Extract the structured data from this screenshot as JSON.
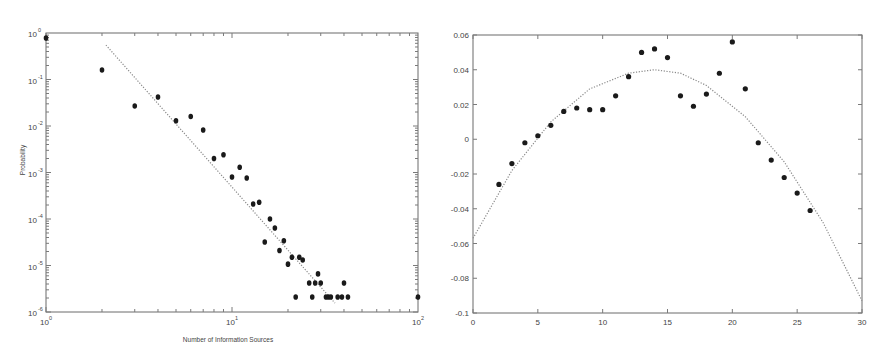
{
  "chart_data": [
    {
      "type": "scatter",
      "title": "",
      "xlabel": "Number of Information Sources",
      "ylabel": "Probability",
      "xscale": "log",
      "yscale": "log",
      "xlim": [
        1,
        100
      ],
      "ylim": [
        1e-06,
        1
      ],
      "x_ticks": [
        {
          "base": "10",
          "exp": "0",
          "value": 1
        },
        {
          "base": "10",
          "exp": "1",
          "value": 10
        },
        {
          "base": "10",
          "exp": "2",
          "value": 100
        }
      ],
      "y_ticks": [
        {
          "base": "10",
          "exp": "0",
          "value": 1
        },
        {
          "base": "10",
          "exp": "-1",
          "value": 0.1
        },
        {
          "base": "10",
          "exp": "-2",
          "value": 0.01
        },
        {
          "base": "10",
          "exp": "-3",
          "value": 0.001
        },
        {
          "base": "10",
          "exp": "-4",
          "value": 0.0001
        },
        {
          "base": "10",
          "exp": "-5",
          "value": 1e-05
        },
        {
          "base": "10",
          "exp": "-6",
          "value": 1e-06
        }
      ],
      "grid": false,
      "legend": null,
      "series": [
        {
          "name": "observed",
          "style": "markers",
          "x": [
            1,
            2,
            3,
            4,
            5,
            6,
            7,
            8,
            9,
            10,
            11,
            12,
            13,
            14,
            15,
            16,
            17,
            18,
            19,
            20,
            21,
            22,
            23,
            24,
            26,
            27,
            28,
            29,
            30,
            32,
            33,
            34,
            37,
            39,
            40,
            42,
            100
          ],
          "y": [
            0.78,
            0.16,
            0.027,
            0.042,
            0.013,
            0.016,
            0.0082,
            0.002,
            0.0024,
            0.0008,
            0.0013,
            0.00076,
            0.00021,
            0.00023,
            3.2e-05,
            0.0001,
            6.4e-05,
            2.1e-05,
            3.4e-05,
            1.07e-05,
            1.5e-05,
            2.1e-06,
            1.5e-05,
            1.31e-05,
            4.2e-06,
            2.1e-06,
            4.2e-06,
            6.6e-06,
            4.2e-06,
            2.1e-06,
            2.1e-06,
            2.1e-06,
            2.1e-06,
            2.1e-06,
            4.2e-06,
            2.1e-06,
            2.1e-06
          ]
        },
        {
          "name": "power-law fit",
          "style": "dotted-line",
          "x": [
            2.1,
            35.8
          ],
          "y": [
            0.55,
            1.55e-06
          ]
        }
      ]
    },
    {
      "type": "scatter",
      "title": "",
      "xlabel": "",
      "ylabel": "",
      "xlim": [
        0,
        30
      ],
      "ylim": [
        -0.1,
        0.06
      ],
      "x_ticks": [
        0,
        5,
        10,
        15,
        20,
        25,
        30
      ],
      "y_ticks": [
        0.06,
        0.04,
        0.02,
        0,
        -0.02,
        -0.04,
        -0.06,
        -0.08,
        -0.1
      ],
      "x_tick_labels": [
        "0",
        "5",
        "10",
        "15",
        "20",
        "25",
        "30"
      ],
      "y_tick_labels": [
        "0.06",
        "0.04",
        "0.02",
        "0",
        "-0.02",
        "-0.04",
        "-0.06",
        "-0.08",
        "-0.1"
      ],
      "grid": false,
      "legend": null,
      "series": [
        {
          "name": "observed",
          "style": "markers",
          "x": [
            2,
            3,
            4,
            5,
            6,
            7,
            8,
            9,
            10,
            11,
            12,
            13,
            14,
            15,
            16,
            17,
            18,
            19,
            20,
            21,
            22,
            23,
            24,
            25,
            26
          ],
          "y": [
            -0.026,
            -0.014,
            -0.002,
            0.002,
            0.008,
            0.016,
            0.018,
            0.017,
            0.017,
            0.025,
            0.036,
            0.05,
            0.052,
            0.047,
            0.025,
            0.019,
            0.026,
            0.038,
            0.056,
            0.029,
            -0.002,
            -0.012,
            -0.022,
            -0.031,
            -0.041
          ]
        },
        {
          "name": "quadratic fit",
          "style": "dotted-line",
          "x": [
            0,
            3,
            6,
            9,
            12,
            14,
            16,
            18,
            21,
            24,
            27,
            30
          ],
          "y": [
            -0.057,
            -0.018,
            0.01,
            0.029,
            0.038,
            0.04,
            0.038,
            0.031,
            0.013,
            -0.013,
            -0.048,
            -0.093
          ]
        }
      ]
    }
  ]
}
